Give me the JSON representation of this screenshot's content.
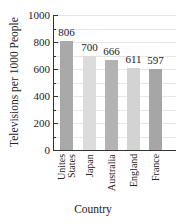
{
  "chart_data": {
    "type": "bar",
    "title": "",
    "xlabel": "Country",
    "ylabel": "Televisions per 1000 People",
    "ylim": [
      0,
      1000
    ],
    "yticks": [
      0,
      200,
      400,
      600,
      800,
      1000
    ],
    "categories": [
      "Unites States",
      "Japan",
      "Australia",
      "England",
      "France"
    ],
    "category_lines": [
      [
        "Unites",
        "States"
      ],
      [
        "Japan"
      ],
      [
        "Australia"
      ],
      [
        "England"
      ],
      [
        "France"
      ]
    ],
    "values": [
      806,
      700,
      666,
      611,
      597
    ],
    "bar_colors": [
      "#a9a9a9",
      "#dcdcdc",
      "#b3b3b3",
      "#d3d3d3",
      "#a6a6a6"
    ],
    "grid": true
  },
  "labels": {
    "xlabel": "Country",
    "ylabel": "Televisions per 1000 People"
  }
}
